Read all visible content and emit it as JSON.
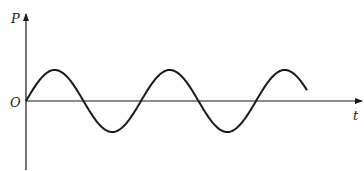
{
  "diagram": {
    "type": "sinusoidal graph",
    "y_axis_label": "P",
    "x_axis_label": "t",
    "origin_label": "O",
    "curve": {
      "shape": "sine",
      "starts_at_origin": true,
      "periods_shown": 2.5,
      "amplitude_px": 31,
      "period_px": 115
    },
    "colors": {
      "line": "#1a1a1a",
      "background": "#ffffff"
    }
  }
}
